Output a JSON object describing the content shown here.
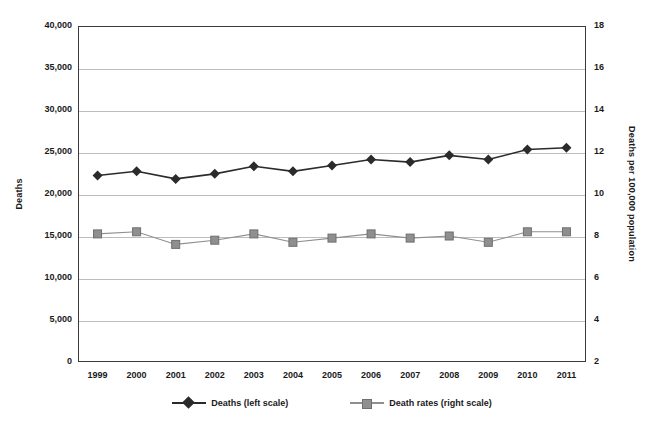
{
  "chart_data": {
    "type": "line",
    "title": "",
    "subtitle": "",
    "xlabel": "",
    "ylabel": "Deaths",
    "y2label": "Deaths per 100,000 population",
    "grid": true,
    "legend_position": "bottom",
    "categories": [
      "1999",
      "2000",
      "2001",
      "2002",
      "2003",
      "2004",
      "2005",
      "2006",
      "2007",
      "2008",
      "2009",
      "2010",
      "2011"
    ],
    "ylim": [
      0,
      40000
    ],
    "yticks": [
      0,
      5000,
      10000,
      15000,
      20000,
      25000,
      30000,
      35000,
      40000
    ],
    "ytick_labels": [
      "0",
      "5,000",
      "10,000",
      "15,000",
      "20,000",
      "25,000",
      "30,000",
      "35,000",
      "40,000"
    ],
    "y2lim": [
      2,
      18
    ],
    "y2ticks": [
      2,
      4,
      6,
      8,
      10,
      12,
      14,
      16,
      18
    ],
    "y2tick_labels": [
      "2",
      "4",
      "6",
      "8",
      "10",
      "12",
      "14",
      "16",
      "18"
    ],
    "series": [
      {
        "name": "Deaths (left scale)",
        "axis": "left",
        "marker": "diamond",
        "color": "#2b2b2b",
        "values": [
          22200,
          22700,
          21800,
          22400,
          23300,
          22700,
          23400,
          24100,
          23800,
          24600,
          24100,
          25300,
          25500
        ]
      },
      {
        "name": "Death rates (right scale)",
        "axis": "right",
        "marker": "square",
        "color": "#8f8f8f",
        "values": [
          8.1,
          8.2,
          7.6,
          7.8,
          8.1,
          7.7,
          7.9,
          8.1,
          7.9,
          8.0,
          7.7,
          8.2,
          8.2
        ]
      }
    ],
    "legend": [
      {
        "label": "Deaths (left scale)",
        "marker": "diamond",
        "color": "#2b2b2b"
      },
      {
        "label": "Death rates (right scale)",
        "marker": "square",
        "color": "#8f8f8f"
      }
    ]
  }
}
